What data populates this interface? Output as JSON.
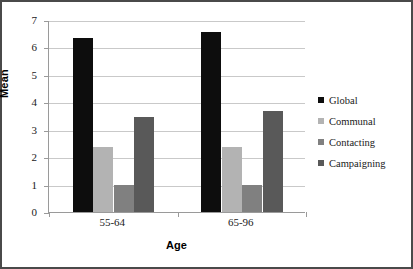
{
  "chart_data": {
    "type": "bar",
    "title": "",
    "xlabel": "Age",
    "ylabel": "Mean",
    "categories": [
      "55-64",
      "65-96"
    ],
    "series": [
      {
        "name": "Global",
        "color": "#0d0d0d",
        "values": [
          6.35,
          6.57
        ]
      },
      {
        "name": "Communal",
        "color": "#b3b3b3",
        "values": [
          2.38,
          2.38
        ]
      },
      {
        "name": "Contacting",
        "color": "#808080",
        "values": [
          1.0,
          0.98
        ]
      },
      {
        "name": "Campaigning",
        "color": "#595959",
        "values": [
          3.45,
          3.7
        ]
      }
    ],
    "ylim": [
      0,
      7
    ],
    "yticks": [
      0,
      1,
      2,
      3,
      4,
      5,
      6,
      7
    ],
    "ytick_labels": [
      "0",
      "1",
      "2",
      "3",
      "4",
      "5",
      "6",
      "7"
    ],
    "grid": true,
    "grid_axis": "y",
    "legend_position": "right",
    "background_color": "#ffffff",
    "border_color": "#4a4a4a",
    "gridline_color": "#c9c9c9",
    "axis_color": "#9a9a9a"
  },
  "legend": {
    "entries": [
      {
        "label": "Global",
        "marker": "square-swatch-black"
      },
      {
        "label": "Communal",
        "marker": "square-swatch-light-gray"
      },
      {
        "label": "Contacting",
        "marker": "square-swatch-medium-gray"
      },
      {
        "label": "Campaigning",
        "marker": "square-swatch-dark-gray"
      }
    ]
  }
}
